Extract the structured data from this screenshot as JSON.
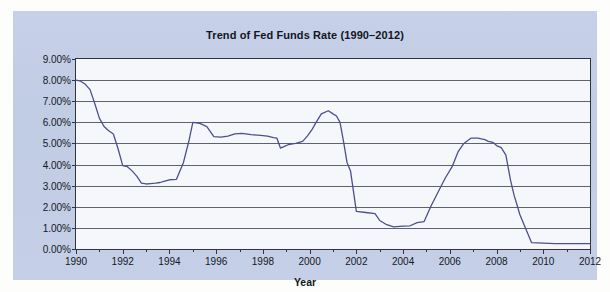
{
  "chart_data": {
    "type": "line",
    "title": "Trend of Fed Funds Rate (1990–2012)",
    "xlabel": "Year",
    "ylabel": "",
    "xlim": [
      1990,
      2012
    ],
    "ylim": [
      0,
      9
    ],
    "grid": true,
    "legend": null,
    "y_tick_labels": [
      "0.00%",
      "1.00%",
      "2.00%",
      "3.00%",
      "4.00%",
      "5.00%",
      "6.00%",
      "7.00%",
      "8.00%",
      "9.00%"
    ],
    "y_tick_values": [
      0,
      1,
      2,
      3,
      4,
      5,
      6,
      7,
      8,
      9
    ],
    "x_tick_labels": [
      "1990",
      "1992",
      "1994",
      "1996",
      "1998",
      "2000",
      "2002",
      "2004",
      "2006",
      "2008",
      "2010",
      "2012"
    ],
    "x_tick_values": [
      1990,
      1992,
      1994,
      1996,
      1998,
      2000,
      2002,
      2004,
      2006,
      2008,
      2010,
      2012
    ],
    "x_minor_tick_values": [
      1991,
      1993,
      1995,
      1997,
      1999,
      2001,
      2003,
      2005,
      2007,
      2009,
      2011
    ],
    "series": [
      {
        "name": "Fed Funds Rate",
        "color": "#4d4f8e",
        "x": [
          1990.0,
          1990.2,
          1990.4,
          1990.6,
          1990.8,
          1991.0,
          1991.2,
          1991.4,
          1991.6,
          1991.8,
          1992.0,
          1992.2,
          1992.4,
          1992.6,
          1992.8,
          1993.0,
          1993.2,
          1993.4,
          1993.6,
          1993.8,
          1994.0,
          1994.3,
          1994.6,
          1994.85,
          1995.0,
          1995.3,
          1995.6,
          1995.9,
          1996.2,
          1996.5,
          1996.8,
          1997.1,
          1997.5,
          1997.9,
          1998.2,
          1998.45,
          1998.6,
          1998.75,
          1998.9,
          1999.1,
          1999.4,
          1999.7,
          1999.9,
          2000.1,
          2000.25,
          2000.5,
          2000.8,
          2001.0,
          2001.15,
          2001.3,
          2001.45,
          2001.6,
          2001.75,
          2002.0,
          2002.4,
          2002.8,
          2003.0,
          2003.3,
          2003.6,
          2004.0,
          2004.3,
          2004.6,
          2004.9,
          2005.2,
          2005.5,
          2005.8,
          2006.1,
          2006.35,
          2006.6,
          2006.9,
          2007.2,
          2007.5,
          2007.65,
          2007.85,
          2008.0,
          2008.2,
          2008.4,
          2008.6,
          2008.75,
          2008.9,
          2009.0,
          2009.5,
          2010.0,
          2010.5,
          2011.0,
          2011.5,
          2012.0
        ],
        "y": [
          8.0,
          7.95,
          7.8,
          7.55,
          6.9,
          6.2,
          5.8,
          5.6,
          5.45,
          4.75,
          3.95,
          3.9,
          3.7,
          3.45,
          3.12,
          3.08,
          3.1,
          3.12,
          3.15,
          3.22,
          3.28,
          3.3,
          4.1,
          5.2,
          6.0,
          5.95,
          5.8,
          5.32,
          5.3,
          5.35,
          5.45,
          5.48,
          5.42,
          5.38,
          5.35,
          5.28,
          5.25,
          4.78,
          4.85,
          4.95,
          5.0,
          5.1,
          5.35,
          5.65,
          5.95,
          6.4,
          6.55,
          6.4,
          6.3,
          6.0,
          5.1,
          4.1,
          3.7,
          1.78,
          1.73,
          1.68,
          1.35,
          1.15,
          1.05,
          1.08,
          1.1,
          1.25,
          1.3,
          2.05,
          2.7,
          3.35,
          3.9,
          4.6,
          5.0,
          5.25,
          5.25,
          5.18,
          5.1,
          5.05,
          4.9,
          4.8,
          4.45,
          3.25,
          2.55,
          2.0,
          1.62,
          0.3,
          0.28,
          0.25,
          0.25,
          0.25,
          0.25
        ],
        "annotations": [
          {
            "label": "1990 start",
            "value": 8.0
          },
          {
            "label": "1992–1993 trough",
            "value": 3.1
          },
          {
            "label": "1995 peak",
            "value": 6.0
          },
          {
            "label": "1998 dip",
            "value": 4.78
          },
          {
            "label": "2000 peak",
            "value": 6.55
          },
          {
            "label": "2003–2004 trough",
            "value": 1.05
          },
          {
            "label": "2006–2007 plateau",
            "value": 5.25
          },
          {
            "label": "2009–2012 zero bound",
            "value": 0.25
          }
        ]
      }
    ]
  },
  "panel": {
    "title": "Trend of Fed Funds Rate (1990–2012)",
    "axis_title_x": "Year"
  },
  "colors": {
    "panel_background": "#c3cde6",
    "plot_background": "#ffffff",
    "grid": "#5d626c",
    "frame": "#30343d",
    "series": "#4d4f8e",
    "text": "#15181e"
  }
}
